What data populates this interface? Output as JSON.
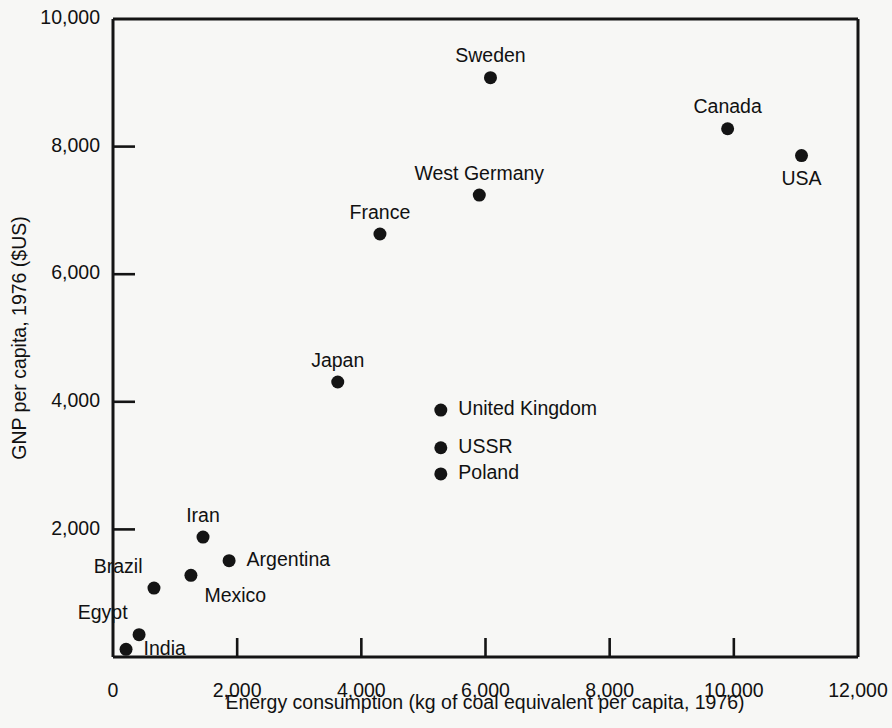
{
  "chart_data": {
    "type": "scatter",
    "title": "",
    "xlabel": "Energy consumption (kg of coal equivalent per capita, 1976)",
    "ylabel": "GNP per capita, 1976 ($US)",
    "xlim": [
      0,
      12000
    ],
    "ylim": [
      0,
      10000
    ],
    "grid": false,
    "legend": "none",
    "xticks": [
      0,
      2000,
      4000,
      6000,
      8000,
      10000,
      12000
    ],
    "xtick_labels": [
      "0",
      "2,000",
      "4,000",
      "6,000",
      "8,000",
      "10,000",
      "12,000"
    ],
    "yticks": [
      2000,
      4000,
      6000,
      8000,
      10000
    ],
    "ytick_labels": [
      "2,000",
      "4,000",
      "6,000",
      "8,000",
      "10,000"
    ],
    "marker": "filled-circle",
    "marker_color": "#141414",
    "points": [
      {
        "label": "Sweden",
        "x": 6080,
        "y": 9080,
        "label_pos": "above"
      },
      {
        "label": "Canada",
        "x": 9900,
        "y": 8280,
        "label_pos": "above"
      },
      {
        "label": "USA",
        "x": 11090,
        "y": 7860,
        "label_pos": "below"
      },
      {
        "label": "West Germany",
        "x": 5900,
        "y": 7240,
        "label_pos": "above"
      },
      {
        "label": "France",
        "x": 4300,
        "y": 6630,
        "label_pos": "above"
      },
      {
        "label": "Japan",
        "x": 3620,
        "y": 4310,
        "label_pos": "above"
      },
      {
        "label": "United Kingdom",
        "x": 5280,
        "y": 3870,
        "label_pos": "right"
      },
      {
        "label": "USSR",
        "x": 5280,
        "y": 3280,
        "label_pos": "right"
      },
      {
        "label": "Poland",
        "x": 5280,
        "y": 2870,
        "label_pos": "right"
      },
      {
        "label": "Iran",
        "x": 1450,
        "y": 1880,
        "label_pos": "above"
      },
      {
        "label": "Argentina",
        "x": 1870,
        "y": 1510,
        "label_pos": "right"
      },
      {
        "label": "Mexico",
        "x": 1255,
        "y": 1280,
        "label_pos": "below-right"
      },
      {
        "label": "Brazil",
        "x": 660,
        "y": 1080,
        "label_pos": "above-left"
      },
      {
        "label": "Egypt",
        "x": 420,
        "y": 350,
        "label_pos": "above-left"
      },
      {
        "label": "India",
        "x": 210,
        "y": 120,
        "label_pos": "right"
      }
    ]
  },
  "axes": {
    "background_color": "#f7f7f5",
    "line_color": "#141414"
  }
}
